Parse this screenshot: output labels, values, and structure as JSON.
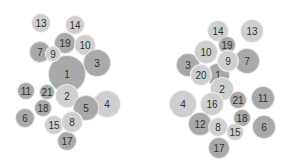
{
  "colors": {
    "mid": "#a9a9a9",
    "light": "#cfcfcf",
    "text": "#333333"
  },
  "clusters": [
    {
      "name": "left-cluster",
      "nodes": [
        {
          "label": "13",
          "x": 41,
          "y": 23,
          "r": 10,
          "tone": "light"
        },
        {
          "label": "14",
          "x": 75,
          "y": 25,
          "r": 10,
          "tone": "light"
        },
        {
          "label": "19",
          "x": 65,
          "y": 43,
          "r": 11,
          "tone": "mid"
        },
        {
          "label": "10",
          "x": 85,
          "y": 45,
          "r": 11,
          "tone": "light"
        },
        {
          "label": "7",
          "x": 40,
          "y": 52,
          "r": 11,
          "tone": "mid"
        },
        {
          "label": "3",
          "x": 97,
          "y": 63,
          "r": 14,
          "tone": "mid"
        },
        {
          "label": "1",
          "x": 67,
          "y": 74,
          "r": 19,
          "tone": "mid"
        },
        {
          "label": "9",
          "x": 53,
          "y": 54,
          "r": 8,
          "tone": "light"
        },
        {
          "label": "11",
          "x": 26,
          "y": 91,
          "r": 9,
          "tone": "mid"
        },
        {
          "label": "2",
          "x": 67,
          "y": 96,
          "r": 12,
          "tone": "light"
        },
        {
          "label": "21",
          "x": 47,
          "y": 92,
          "r": 8,
          "tone": "mid"
        },
        {
          "label": "4",
          "x": 107,
          "y": 104,
          "r": 14,
          "tone": "light"
        },
        {
          "label": "5",
          "x": 86,
          "y": 108,
          "r": 13,
          "tone": "mid"
        },
        {
          "label": "18",
          "x": 43,
          "y": 108,
          "r": 9,
          "tone": "mid"
        },
        {
          "label": "6",
          "x": 25,
          "y": 118,
          "r": 10,
          "tone": "mid"
        },
        {
          "label": "17",
          "x": 67,
          "y": 141,
          "r": 10,
          "tone": "mid"
        },
        {
          "label": "15",
          "x": 54,
          "y": 125,
          "r": 10,
          "tone": "light"
        },
        {
          "label": "8",
          "x": 72,
          "y": 122,
          "r": 11,
          "tone": "light"
        }
      ]
    },
    {
      "name": "right-cluster",
      "nodes": [
        {
          "label": "14",
          "x": 218,
          "y": 31,
          "r": 11,
          "tone": "light"
        },
        {
          "label": "13",
          "x": 252,
          "y": 31,
          "r": 12,
          "tone": "light"
        },
        {
          "label": "19",
          "x": 227,
          "y": 45,
          "r": 9,
          "tone": "mid"
        },
        {
          "label": "3",
          "x": 188,
          "y": 65,
          "r": 12,
          "tone": "mid"
        },
        {
          "label": "1",
          "x": 218,
          "y": 75,
          "r": 12,
          "tone": "mid"
        },
        {
          "label": "10",
          "x": 206,
          "y": 52,
          "r": 12,
          "tone": "light"
        },
        {
          "label": "7",
          "x": 247,
          "y": 61,
          "r": 13,
          "tone": "mid"
        },
        {
          "label": "9",
          "x": 228,
          "y": 61,
          "r": 11,
          "tone": "light"
        },
        {
          "label": "20",
          "x": 201,
          "y": 75,
          "r": 11,
          "tone": "light"
        },
        {
          "label": "2",
          "x": 222,
          "y": 89,
          "r": 12,
          "tone": "light"
        },
        {
          "label": "11",
          "x": 263,
          "y": 98,
          "r": 12,
          "tone": "mid"
        },
        {
          "label": "4",
          "x": 183,
          "y": 104,
          "r": 14,
          "tone": "light"
        },
        {
          "label": "16",
          "x": 212,
          "y": 104,
          "r": 12,
          "tone": "light"
        },
        {
          "label": "21",
          "x": 238,
          "y": 100,
          "r": 9,
          "tone": "mid"
        },
        {
          "label": "12",
          "x": 200,
          "y": 124,
          "r": 12,
          "tone": "mid"
        },
        {
          "label": "18",
          "x": 242,
          "y": 118,
          "r": 9,
          "tone": "mid"
        },
        {
          "label": "6",
          "x": 264,
          "y": 127,
          "r": 12,
          "tone": "mid"
        },
        {
          "label": "8",
          "x": 218,
          "y": 127,
          "r": 10,
          "tone": "light"
        },
        {
          "label": "15",
          "x": 235,
          "y": 132,
          "r": 9,
          "tone": "light"
        },
        {
          "label": "17",
          "x": 219,
          "y": 148,
          "r": 11,
          "tone": "mid"
        }
      ]
    }
  ]
}
